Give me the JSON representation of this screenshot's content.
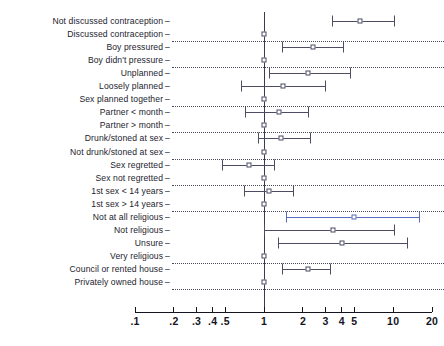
{
  "chart_data": {
    "type": "scatter",
    "subtype": "forest-plot",
    "title": "",
    "xlabel": "",
    "ylabel": "",
    "xscale": "log",
    "xlim": [
      0.1,
      20
    ],
    "grid": "dotted horizontal separators between variable groups",
    "legend": "none",
    "null_value": 1,
    "xticks": [
      {
        "value": 0.1,
        "label": ".1"
      },
      {
        "value": 0.2,
        "label": ".2"
      },
      {
        "value": 0.3,
        "label": ".3"
      },
      {
        "value": 0.4,
        "label": ".4"
      },
      {
        "value": 0.5,
        "label": ".5"
      },
      {
        "value": 1,
        "label": "1"
      },
      {
        "value": 2,
        "label": "2"
      },
      {
        "value": 3,
        "label": "3"
      },
      {
        "value": 4,
        "label": "4"
      },
      {
        "value": 5,
        "label": "5"
      },
      {
        "value": 10,
        "label": "10"
      },
      {
        "value": 20,
        "label": "20"
      }
    ],
    "categories": [
      "Not discussed contraception",
      "Discussed contraception",
      "Boy pressured",
      "Boy didn't pressure",
      "Unplanned",
      "Loosely planned",
      "Sex planned together",
      "Partner < month",
      "Partner > month",
      "Drunk/stoned at sex",
      "Not drunk/stoned at sex",
      "Sex regretted",
      "Sex not regretted",
      "1st sex < 14 years",
      "1st sex > 14 years",
      "Not at all religious",
      "Not religious",
      "Unsure",
      "Very religious",
      "Council or rented house",
      "Privately owned house"
    ],
    "points": [
      {
        "label": "Not discussed contraception",
        "estimate": 5.5,
        "low": 3.4,
        "high": 10.2,
        "reference": false,
        "highlight": false
      },
      {
        "label": "Discussed contraception",
        "estimate": 1.0,
        "low": 1.0,
        "high": 1.0,
        "reference": true,
        "highlight": false
      },
      {
        "label": "Boy pressured",
        "estimate": 2.4,
        "low": 1.4,
        "high": 4.1,
        "reference": false,
        "highlight": false
      },
      {
        "label": "Boy didn't pressure",
        "estimate": 1.0,
        "low": 1.0,
        "high": 1.0,
        "reference": true,
        "highlight": false
      },
      {
        "label": "Unplanned",
        "estimate": 2.2,
        "low": 1.1,
        "high": 4.7,
        "reference": false,
        "highlight": false
      },
      {
        "label": "Loosely planned",
        "estimate": 1.4,
        "low": 0.67,
        "high": 3.0,
        "reference": false,
        "highlight": false
      },
      {
        "label": "Sex planned together",
        "estimate": 1.0,
        "low": 1.0,
        "high": 1.0,
        "reference": true,
        "highlight": false
      },
      {
        "label": "Partner < month",
        "estimate": 1.3,
        "low": 0.72,
        "high": 2.2,
        "reference": false,
        "highlight": false
      },
      {
        "label": "Partner > month",
        "estimate": 1.0,
        "low": 1.0,
        "high": 1.0,
        "reference": true,
        "highlight": false
      },
      {
        "label": "Drunk/stoned at sex",
        "estimate": 1.35,
        "low": 0.9,
        "high": 2.3,
        "reference": false,
        "highlight": false
      },
      {
        "label": "Not drunk/stoned at sex",
        "estimate": 1.0,
        "low": 1.0,
        "high": 1.0,
        "reference": true,
        "highlight": false
      },
      {
        "label": "Sex regretted",
        "estimate": 0.76,
        "low": 0.48,
        "high": 1.2,
        "reference": false,
        "highlight": false
      },
      {
        "label": "Sex not regretted",
        "estimate": 1.0,
        "low": 1.0,
        "high": 1.0,
        "reference": true,
        "highlight": false
      },
      {
        "label": "1st sex < 14 years",
        "estimate": 1.1,
        "low": 0.7,
        "high": 1.7,
        "reference": false,
        "highlight": false
      },
      {
        "label": "1st sex > 14 years",
        "estimate": 1.0,
        "low": 1.0,
        "high": 1.0,
        "reference": true,
        "highlight": false
      },
      {
        "label": "Not at all religious",
        "estimate": 5.0,
        "low": 1.5,
        "high": 16.0,
        "reference": false,
        "highlight": true
      },
      {
        "label": "Not religious",
        "estimate": 3.4,
        "low": 1.0,
        "high": 10.3,
        "reference": false,
        "highlight": false
      },
      {
        "label": "Unsure",
        "estimate": 4.0,
        "low": 1.3,
        "high": 13.0,
        "reference": false,
        "highlight": false
      },
      {
        "label": "Very religious",
        "estimate": 1.0,
        "low": 1.0,
        "high": 1.0,
        "reference": true,
        "highlight": false
      },
      {
        "label": "Council or rented house",
        "estimate": 2.2,
        "low": 1.4,
        "high": 3.3,
        "reference": false,
        "highlight": false
      },
      {
        "label": "Privately owned house",
        "estimate": 1.0,
        "low": 1.0,
        "high": 1.0,
        "reference": true,
        "highlight": false
      }
    ],
    "separators_after": [
      "Discussed contraception",
      "Boy didn't pressure",
      "Sex planned together",
      "Partner > month",
      "Not drunk/stoned at sex",
      "Sex not regretted",
      "1st sex > 14 years",
      "Very religious",
      "Privately owned house"
    ],
    "colors": {
      "marker": "#4a4a63",
      "ci": "#4c4c63",
      "highlight": "#5a6bbf",
      "axis": "#14141f",
      "guide": "#2a2a3a",
      "background": "#ffffff"
    }
  }
}
